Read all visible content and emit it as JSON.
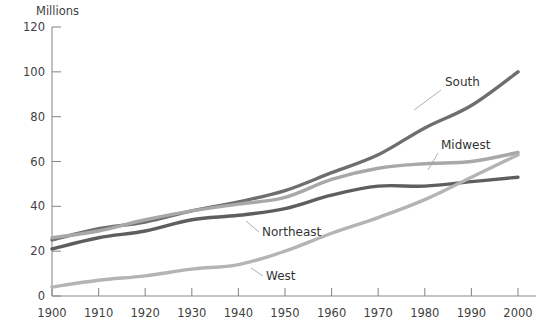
{
  "chart_data": {
    "type": "line",
    "title": "",
    "subtitle": "",
    "xlabel": "",
    "ylabel": "Millions",
    "ylabel_position": "top-left",
    "xlim": [
      1900,
      2000
    ],
    "ylim": [
      0,
      120
    ],
    "ytick_step": 20,
    "xtick_step": 10,
    "grid": false,
    "legend": "inline-labels-with-leader-lines",
    "x": [
      1900,
      1910,
      1920,
      1930,
      1940,
      1950,
      1960,
      1970,
      1980,
      1990,
      2000
    ],
    "xtick_labels": [
      "1900",
      "1910",
      "1920",
      "1930",
      "1940",
      "1950",
      "1960",
      "1970",
      "1980",
      "1990",
      "2000"
    ],
    "ytick_labels": [
      "0",
      "20",
      "40",
      "60",
      "80",
      "100",
      "120"
    ],
    "ytick_values": [
      0,
      20,
      40,
      60,
      80,
      100,
      120
    ],
    "series": [
      {
        "name": "South",
        "label": "South",
        "color": "#6e6e6e",
        "stroke_width": 3.4,
        "values": [
          25,
          30,
          33,
          38,
          42,
          47,
          55,
          63,
          75,
          85,
          100
        ],
        "label_x": 445,
        "label_y": 86,
        "leader": "M 441 90 L 414 110"
      },
      {
        "name": "Midwest",
        "label": "Midwest",
        "color": "#a8a8a8",
        "stroke_width": 3.4,
        "values": [
          26,
          29,
          34,
          38,
          41,
          44,
          52,
          57,
          59,
          60,
          64
        ],
        "label_x": 441,
        "label_y": 149,
        "leader": "M 438 153 L 428 170"
      },
      {
        "name": "Northeast",
        "label": "Northeast",
        "color": "#5e5e5e",
        "stroke_width": 3.4,
        "values": [
          21,
          26,
          29,
          34,
          36,
          39,
          45,
          49,
          49,
          51,
          53
        ],
        "label_x": 262,
        "label_y": 236,
        "leader": "M 259 232 L 246 221"
      },
      {
        "name": "West",
        "label": "West",
        "color": "#b4b4b4",
        "stroke_width": 3.4,
        "values": [
          4,
          7,
          9,
          12,
          14,
          20,
          28,
          35,
          43,
          53,
          63
        ],
        "label_x": 266,
        "label_y": 280,
        "leader": "M 263 276 L 251 268"
      }
    ]
  },
  "colors": {
    "axis": "#8c8c8c",
    "text": "#3f3f3f",
    "background": "#ffffff",
    "south": "#6e6e6e",
    "midwest": "#a8a8a8",
    "northeast": "#5e5e5e",
    "west": "#b4b4b4"
  }
}
